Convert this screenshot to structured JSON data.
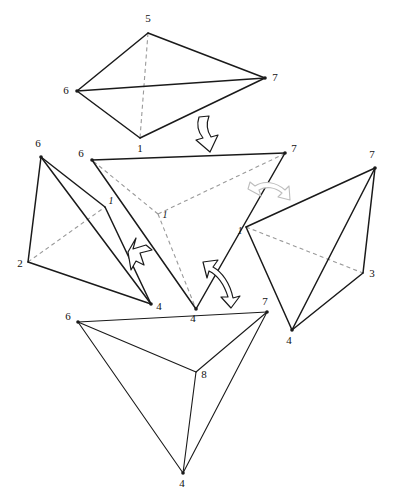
{
  "figure": {
    "background_color": "#ffffff",
    "line_color": "#1a1a1a",
    "hidden_line_color": "#9a9a9a",
    "width": 395,
    "height": 504
  },
  "shapes": [
    {
      "id": "top-tetrahedron",
      "name": "tetrahedron-5-6-7-1",
      "vertices": [
        {
          "label": "5",
          "x": 148,
          "y": 33,
          "label_x": 148,
          "label_y": 22,
          "style": "upright"
        },
        {
          "label": "6",
          "x": 77,
          "y": 91,
          "label_x": 66,
          "label_y": 94,
          "style": "upright"
        },
        {
          "label": "7",
          "x": 265,
          "y": 78,
          "label_x": 275,
          "label_y": 81,
          "style": "upright"
        },
        {
          "label": "1",
          "x": 140,
          "y": 138,
          "label_x": 140,
          "label_y": 152,
          "style": "upright"
        }
      ],
      "solid_edges": [
        [
          0,
          1
        ],
        [
          0,
          2
        ],
        [
          1,
          2
        ],
        [
          1,
          3
        ],
        [
          2,
          3
        ]
      ],
      "dashed_edges": [
        [
          0,
          3
        ]
      ]
    },
    {
      "id": "center-tetrahedron",
      "name": "tetrahedron-6-7-4-1",
      "vertices": [
        {
          "label": "6",
          "x": 92,
          "y": 160,
          "label_x": 81,
          "label_y": 157,
          "style": "upright"
        },
        {
          "label": "7",
          "x": 285,
          "y": 153,
          "label_x": 294,
          "label_y": 152,
          "style": "upright"
        },
        {
          "label": "4",
          "x": 196,
          "y": 309,
          "label_x": 193,
          "label_y": 322,
          "style": "upright"
        },
        {
          "label": "1",
          "x": 158,
          "y": 214,
          "label_x": 165,
          "label_y": 218,
          "style": "italic"
        }
      ],
      "solid_edges": [
        [
          0,
          1
        ],
        [
          0,
          2
        ],
        [
          1,
          2
        ]
      ],
      "dashed_edges": [
        [
          3,
          0
        ],
        [
          3,
          1
        ],
        [
          3,
          2
        ]
      ]
    },
    {
      "id": "left-tetrahedron",
      "name": "tetrahedron-6-2-4-1",
      "vertices": [
        {
          "label": "6",
          "x": 41,
          "y": 157,
          "label_x": 38,
          "label_y": 147,
          "style": "upright"
        },
        {
          "label": "2",
          "x": 28,
          "y": 262,
          "label_x": 20,
          "label_y": 267,
          "style": "upright"
        },
        {
          "label": "4",
          "x": 151,
          "y": 304,
          "label_x": 159,
          "label_y": 310,
          "style": "upright"
        },
        {
          "label": "1",
          "x": 105,
          "y": 207,
          "label_x": 111,
          "label_y": 204,
          "style": "italic"
        }
      ],
      "solid_edges": [
        [
          0,
          1
        ],
        [
          0,
          2
        ],
        [
          0,
          3
        ],
        [
          1,
          2
        ],
        [
          2,
          3
        ]
      ],
      "dashed_edges": [
        [
          1,
          3
        ]
      ]
    },
    {
      "id": "right-tetrahedron",
      "name": "tetrahedron-7-1-3-4",
      "vertices": [
        {
          "label": "7",
          "x": 375,
          "y": 168,
          "label_x": 372,
          "label_y": 158,
          "style": "upright"
        },
        {
          "label": "1",
          "x": 246,
          "y": 227,
          "label_x": 240,
          "label_y": 234,
          "style": "italic"
        },
        {
          "label": "3",
          "x": 363,
          "y": 273,
          "label_x": 372,
          "label_y": 277,
          "style": "upright"
        },
        {
          "label": "4",
          "x": 292,
          "y": 330,
          "label_x": 289,
          "label_y": 344,
          "style": "upright"
        }
      ],
      "solid_edges": [
        [
          0,
          1
        ],
        [
          0,
          2
        ],
        [
          0,
          3
        ],
        [
          1,
          3
        ],
        [
          2,
          3
        ]
      ],
      "dashed_edges": [
        [
          1,
          2
        ]
      ]
    },
    {
      "id": "bottom-tetrahedron",
      "name": "tetrahedron-6-7-8-4",
      "vertices": [
        {
          "label": "6",
          "x": 78,
          "y": 322,
          "label_x": 68,
          "label_y": 320,
          "style": "upright"
        },
        {
          "label": "7",
          "x": 267,
          "y": 312,
          "label_x": 265,
          "label_y": 305,
          "style": "upright"
        },
        {
          "label": "8",
          "x": 196,
          "y": 372,
          "label_x": 204,
          "label_y": 378,
          "style": "upright"
        },
        {
          "label": "4",
          "x": 183,
          "y": 473,
          "label_x": 182,
          "label_y": 487,
          "style": "upright"
        }
      ],
      "solid_edges": [
        [
          0,
          1
        ],
        [
          0,
          2
        ],
        [
          0,
          3
        ],
        [
          1,
          2
        ],
        [
          1,
          3
        ],
        [
          2,
          3
        ]
      ],
      "dashed_edges": []
    }
  ],
  "arrows": [
    {
      "id": "arrow-top-down",
      "name": "arrow-down-to-center",
      "direction": "down",
      "style": "hollow-block"
    },
    {
      "id": "arrow-left",
      "name": "arrow-up-right-to-center",
      "direction": "up-right",
      "style": "hollow-block"
    },
    {
      "id": "arrow-bottom",
      "name": "arrow-up-left-curved",
      "direction": "up-left",
      "style": "hollow-curved"
    },
    {
      "id": "arrow-right",
      "name": "arrow-left-curved-faded",
      "direction": "left",
      "style": "hollow-curved-faded"
    }
  ]
}
